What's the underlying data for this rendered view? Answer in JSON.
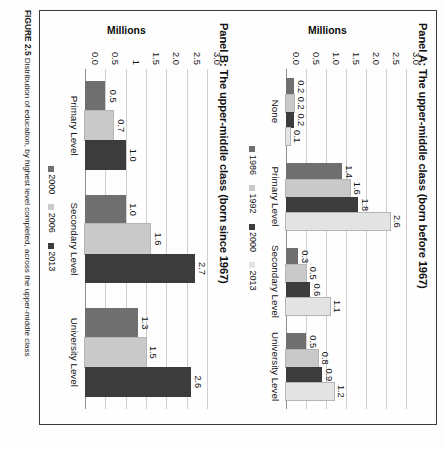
{
  "figure": {
    "caption_label": "FIGURE 2.5",
    "caption_text": "Distribution of education, by highest level completed, across the upper-middle class"
  },
  "colors": {
    "c1986": "#6f6f6f",
    "c1992": "#c9c9c9",
    "c2000": "#3c3c3c",
    "c2013": "#e3e3e3",
    "b2000": "#6f6f6f",
    "b2006": "#c9c9c9",
    "b2013": "#3c3c3c",
    "grid": "#cfcfcf",
    "axis": "#8f8f8f"
  },
  "chart_data": [
    {
      "id": "panel_a",
      "type": "bar",
      "title": "Panel A: The upper-middle class (born before 1967)",
      "xlabel": "",
      "ylabel": "Millions",
      "ylim": [
        0,
        3.0
      ],
      "yticks": [
        "0.0",
        "0.5",
        "1.0",
        "1.5",
        "2.0",
        "2.5",
        "3.0"
      ],
      "ytick_values": [
        0.0,
        0.5,
        1.0,
        1.5,
        2.0,
        2.5,
        3.0
      ],
      "grid": true,
      "legend_position": "bottom",
      "categories": [
        "None",
        "Primary Level",
        "Secondary Level",
        "University Level"
      ],
      "series": [
        {
          "name": "1986",
          "color_key": "c1986",
          "values": [
            0.2,
            1.4,
            0.3,
            0.5
          ],
          "labels": [
            "0.2",
            "1.4",
            "0.3",
            "0.5"
          ]
        },
        {
          "name": "1992",
          "color_key": "c1992",
          "values": [
            0.2,
            1.6,
            0.5,
            0.8
          ],
          "labels": [
            "0.2",
            "1.6",
            "0.5",
            "0.8"
          ]
        },
        {
          "name": "2000",
          "color_key": "c2000",
          "values": [
            0.2,
            1.8,
            0.6,
            0.9
          ],
          "labels": [
            "0.2",
            "1.8",
            "0.6",
            "0.9"
          ]
        },
        {
          "name": "2013",
          "color_key": "c2013",
          "values": [
            0.1,
            2.6,
            1.1,
            1.2
          ],
          "labels": [
            "0.1",
            "2.6",
            "1.1",
            "1.2"
          ]
        }
      ]
    },
    {
      "id": "panel_b",
      "type": "bar",
      "title": "Panel B: The upper-middle class (born since 1967)",
      "xlabel": "",
      "ylabel": "Millions",
      "ylim": [
        0,
        3.0
      ],
      "yticks": [
        "0.0",
        "0.5",
        "1",
        "1.5",
        "2.0",
        "2.5",
        "3.0"
      ],
      "ytick_values": [
        0.0,
        0.5,
        1.0,
        1.5,
        2.0,
        2.5,
        3.0
      ],
      "grid": true,
      "legend_position": "bottom",
      "categories": [
        "Primary Level",
        "Secondary Level",
        "University Level"
      ],
      "series": [
        {
          "name": "2000",
          "color_key": "b2000",
          "values": [
            0.5,
            1.0,
            1.3
          ],
          "labels": [
            "0.5",
            "1.0",
            "1.3"
          ]
        },
        {
          "name": "2006",
          "color_key": "b2006",
          "values": [
            0.7,
            1.6,
            1.5
          ],
          "labels": [
            "0.7",
            "1.6",
            "1.5"
          ]
        },
        {
          "name": "2013",
          "color_key": "b2013",
          "values": [
            1.0,
            2.7,
            2.6
          ],
          "labels": [
            "1.0",
            "2.7",
            "2.6"
          ]
        }
      ]
    }
  ]
}
